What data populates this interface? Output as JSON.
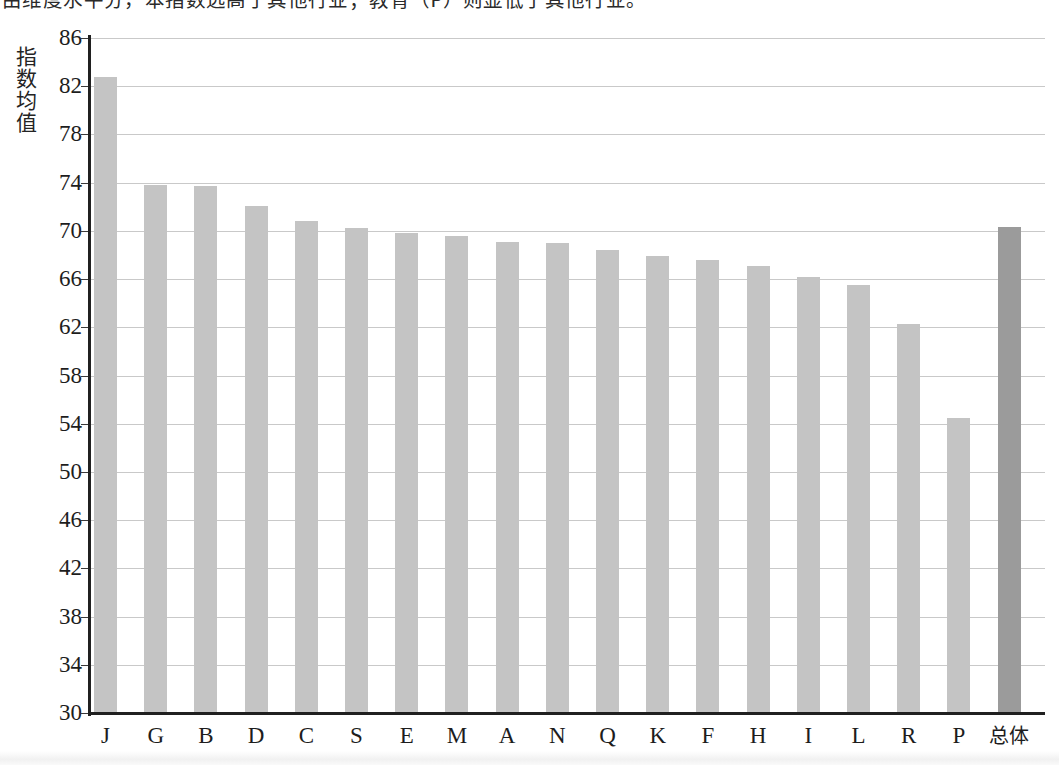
{
  "caption": {
    "text": "由维度水平分，本指数远高于其他行业；教育（P）则显低于其他行业。"
  },
  "chart_data": {
    "type": "bar",
    "title": "",
    "xlabel": "",
    "ylabel": "指数均值",
    "ylim": [
      30,
      86
    ],
    "ytick_step": 4,
    "grid": true,
    "legend": "none",
    "categories": [
      "J",
      "G",
      "B",
      "D",
      "C",
      "S",
      "E",
      "M",
      "A",
      "N",
      "Q",
      "K",
      "F",
      "H",
      "I",
      "L",
      "R",
      "P",
      "总体"
    ],
    "values": [
      82.8,
      73.8,
      73.7,
      72.1,
      70.8,
      70.2,
      69.8,
      69.6,
      69.1,
      69.0,
      68.4,
      67.9,
      67.6,
      67.1,
      66.2,
      65.5,
      62.3,
      54.5,
      70.3
    ],
    "ytick_labels": [
      "86",
      "82",
      "78",
      "74",
      "70",
      "66",
      "62",
      "58",
      "54",
      "50",
      "46",
      "42",
      "38",
      "34",
      "30"
    ],
    "highlight_category": "总体",
    "colors": {
      "bar": "#c4c4c4",
      "bar_highlight": "#9b9b9b",
      "grid": "#c9c9c9",
      "axis": "#202020",
      "text": "#1d1d1d"
    }
  }
}
